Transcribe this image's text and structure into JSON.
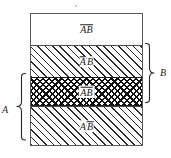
{
  "figure": {
    "type": "venn-band-diagram",
    "box": {
      "border_color": "#5a5a5a",
      "background": "#ffffff"
    },
    "bands": [
      {
        "id": "band-1",
        "fill": "blank",
        "label": "ĀB̄",
        "label_parts": [
          {
            "text": "AB",
            "overbar": true
          }
        ],
        "meaning": "not-A and not-B"
      },
      {
        "id": "band-2",
        "fill": "diagonal-hatch",
        "label": "ĀB",
        "label_parts": [
          {
            "text": "A",
            "overbar": true
          },
          {
            "text": "B",
            "overbar": false
          }
        ],
        "meaning": "not-A and B"
      },
      {
        "id": "band-3",
        "fill": "cross-hatch",
        "label": "AB",
        "label_parts": [
          {
            "text": "AB",
            "overbar": true
          }
        ],
        "meaning": "A and B"
      },
      {
        "id": "band-4",
        "fill": "diagonal-hatch",
        "label": "AB̄",
        "label_parts": [
          {
            "text": "A",
            "overbar": false
          },
          {
            "text": "B",
            "overbar": true
          }
        ],
        "meaning": "A and not-B"
      }
    ],
    "braces": [
      {
        "id": "brace-b",
        "label": "B",
        "side": "right",
        "spans": [
          "band-2",
          "band-3"
        ]
      },
      {
        "id": "brace-a",
        "label": "A",
        "side": "left",
        "spans": [
          "band-3",
          "band-4"
        ]
      }
    ],
    "colors": {
      "ink": "#1c1c1c",
      "rule": "#5a5a5a",
      "hatch": "#2b2b2b",
      "crosshatch": "#111111",
      "paper": "#ffffff"
    }
  }
}
